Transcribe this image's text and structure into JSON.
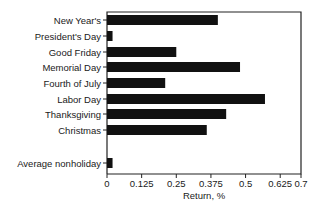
{
  "chart_data": {
    "type": "bar",
    "orientation": "horizontal",
    "title": "",
    "xlabel": "Return, %",
    "ylabel": "",
    "xlim": [
      0,
      0.7
    ],
    "xticks": [
      0,
      0.125,
      0.25,
      0.375,
      0.5,
      0.625,
      0.7
    ],
    "xtick_labels": [
      "0",
      "0.125",
      "0.25",
      "0.375",
      "0.5",
      "0.625",
      "0.7"
    ],
    "grid": false,
    "legend": null,
    "categories": [
      "New Year's",
      "President's Day",
      "Good Friday",
      "Memorial Day",
      "Fourth of July",
      "Labor Day",
      "Thanksgiving",
      "Christmas",
      "Average nonholiday"
    ],
    "values": [
      0.4,
      0.02,
      0.25,
      0.48,
      0.21,
      0.57,
      0.43,
      0.36,
      0.02
    ],
    "bar_color": "#111111"
  }
}
